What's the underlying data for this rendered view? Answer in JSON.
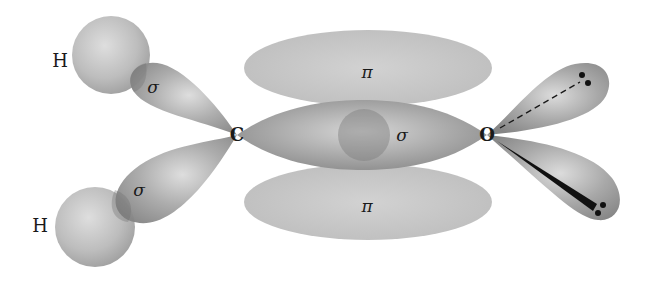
{
  "diagram": {
    "atoms": {
      "h_top": "H",
      "h_bottom": "H",
      "carbon": "C",
      "oxygen": "O"
    },
    "bond_labels": {
      "sigma_ch_top": "σ",
      "sigma_ch_bottom": "σ",
      "sigma_co": "σ",
      "pi_top": "π",
      "pi_bottom": "π"
    },
    "lone_pairs": {
      "upper": "lone pair (dashed, behind plane)",
      "lower": "lone pair (wedge, in front of plane)"
    },
    "colors": {
      "background": "#ffffff",
      "lobe_dark": "#8a8a8a",
      "lobe_light": "#c9c9c9",
      "pi_fill": "#c4c4c4",
      "h_sphere": "#b8b8b8",
      "text": "#1a1a1a"
    }
  }
}
